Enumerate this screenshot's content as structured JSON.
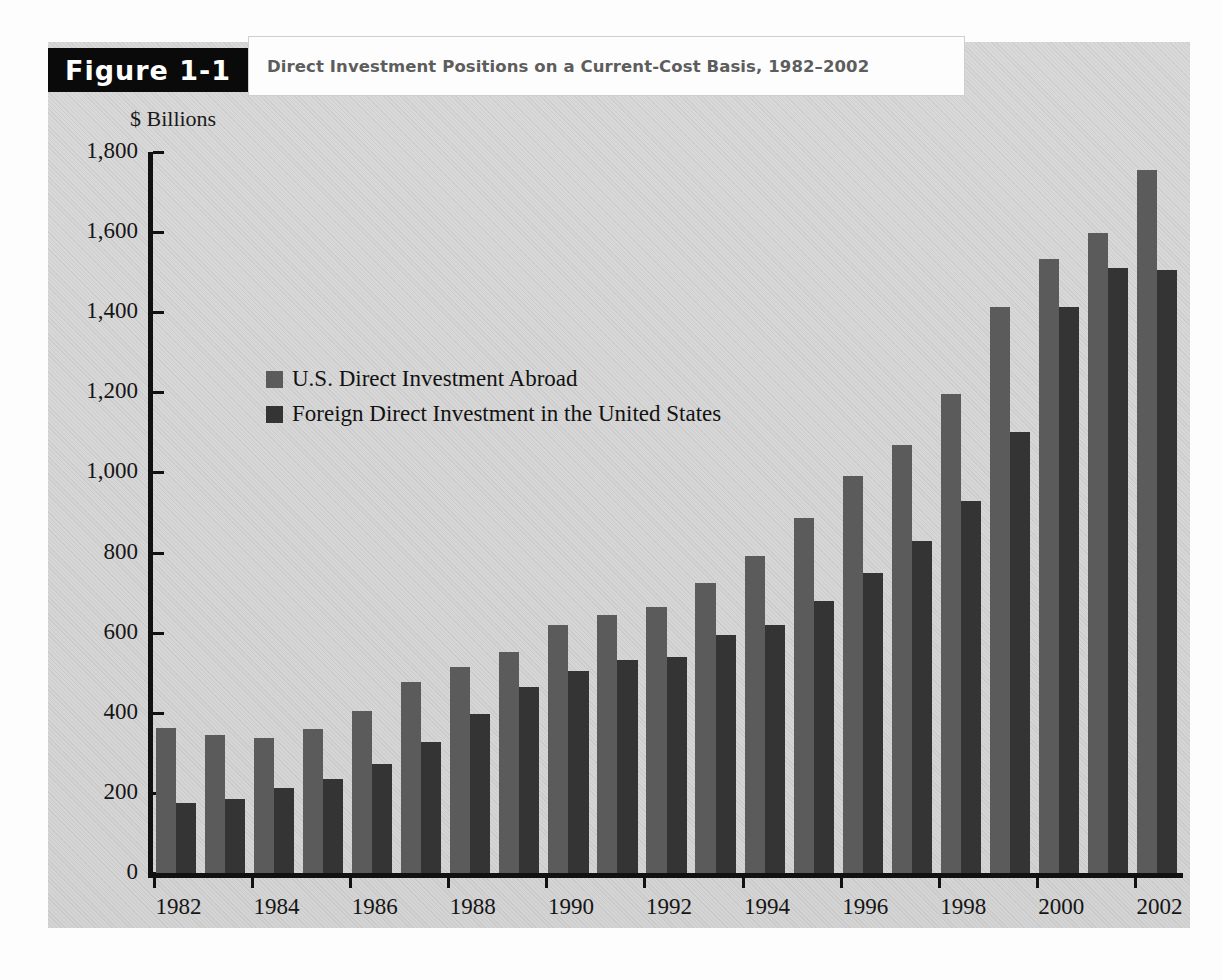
{
  "figure": {
    "number_label": "Figure 1-1",
    "title": "Direct Investment Positions on a Current-Cost Basis, 1982–2002"
  },
  "colors": {
    "series_1": "#5b5b5b",
    "series_2": "#343434",
    "panel_background": "#d7d7d7",
    "tab_background": "#0a0a0a",
    "title_text": "#5d5d5d"
  },
  "chart_data": {
    "type": "bar",
    "title": "Direct Investment Positions on a Current-Cost Basis, 1982–2002",
    "xlabel": "",
    "ylabel": "$ Billions",
    "ylim": [
      0,
      1800
    ],
    "yticks": [
      0,
      200,
      400,
      600,
      800,
      1000,
      1200,
      1400,
      1600,
      1800
    ],
    "ytick_labels": [
      "0",
      "200",
      "400",
      "600",
      "800",
      "1,000",
      "1,200",
      "1,400",
      "1,600",
      "1,800"
    ],
    "grid": false,
    "legend_position": "upper left inside",
    "categories": [
      1982,
      1983,
      1984,
      1985,
      1986,
      1987,
      1988,
      1989,
      1990,
      1991,
      1992,
      1993,
      1994,
      1995,
      1996,
      1997,
      1998,
      1999,
      2000,
      2001,
      2002
    ],
    "xtick_labels": [
      "1982",
      "1984",
      "1986",
      "1988",
      "1990",
      "1992",
      "1994",
      "1996",
      "1998",
      "2000",
      "2002"
    ],
    "series": [
      {
        "name": "U.S. Direct Investment Abroad",
        "color": "#5b5b5b",
        "values": [
          361,
          345,
          336,
          360,
          404,
          477,
          514,
          552,
          620,
          643,
          663,
          723,
          791,
          886,
          990,
          1069,
          1196,
          1414,
          1532,
          1598,
          1756
        ]
      },
      {
        "name": "Foreign Direct Investment in the United States",
        "color": "#343434",
        "values": [
          176,
          185,
          212,
          235,
          272,
          326,
          398,
          464,
          505,
          533,
          540,
          593,
          618,
          680,
          750,
          828,
          928,
          1101,
          1412,
          1510,
          1505
        ]
      }
    ]
  },
  "legend": {
    "items": [
      {
        "label": "U.S. Direct Investment Abroad",
        "color": "#5b5b5b"
      },
      {
        "label": "Foreign Direct Investment in the United States",
        "color": "#343434"
      }
    ]
  }
}
